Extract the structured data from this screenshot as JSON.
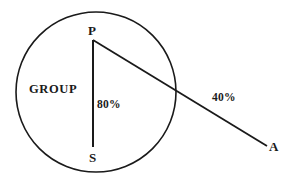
{
  "figure": {
    "background_color": "#ffffff",
    "stroke_color": "#1a1a1a"
  },
  "circle": {
    "name": "group-circle",
    "center_x": 96,
    "center_y": 92,
    "radius": 80,
    "stroke_width": 1.6,
    "region_label": "GROUP"
  },
  "points": {
    "P": {
      "label": "P",
      "x": 93,
      "y": 40
    },
    "S": {
      "label": "S",
      "x": 93,
      "y": 147
    },
    "A": {
      "label": "A",
      "x": 267,
      "y": 146
    }
  },
  "segments": [
    {
      "name": "segment-PS",
      "from": "P",
      "to": "S",
      "x1": 93,
      "y1": 40,
      "x2": 93,
      "y2": 147,
      "stroke_width": 2.0,
      "value_label": "80%"
    },
    {
      "name": "segment-PA",
      "from": "P",
      "to": "A",
      "x1": 93,
      "y1": 40,
      "x2": 267,
      "y2": 146,
      "stroke_width": 1.8,
      "value_label": "40%"
    }
  ],
  "labels": {
    "vertex_P": "P",
    "vertex_S": "S",
    "vertex_A": "A",
    "region": "GROUP",
    "value_vertical": "80%",
    "value_diagonal": "40%"
  }
}
